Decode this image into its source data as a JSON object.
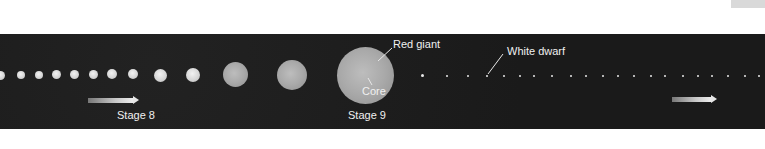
{
  "diagram": {
    "type": "stellar-evolution-sequence",
    "stages": [
      {
        "label": "Stage 8",
        "x": 152,
        "y": 116
      },
      {
        "label": "Stage 9",
        "x": 364,
        "y": 116
      }
    ],
    "annotations": [
      {
        "label": "Red giant",
        "x": 392,
        "y": 38
      },
      {
        "label": "Core",
        "x": 362,
        "y": 87
      },
      {
        "label": "White dwarf",
        "x": 507,
        "y": 45
      }
    ],
    "colors": {
      "background": "#1b1b1b",
      "star": "#d6d6d6",
      "text": "#f0f0f0",
      "page": "#ffffff"
    }
  }
}
